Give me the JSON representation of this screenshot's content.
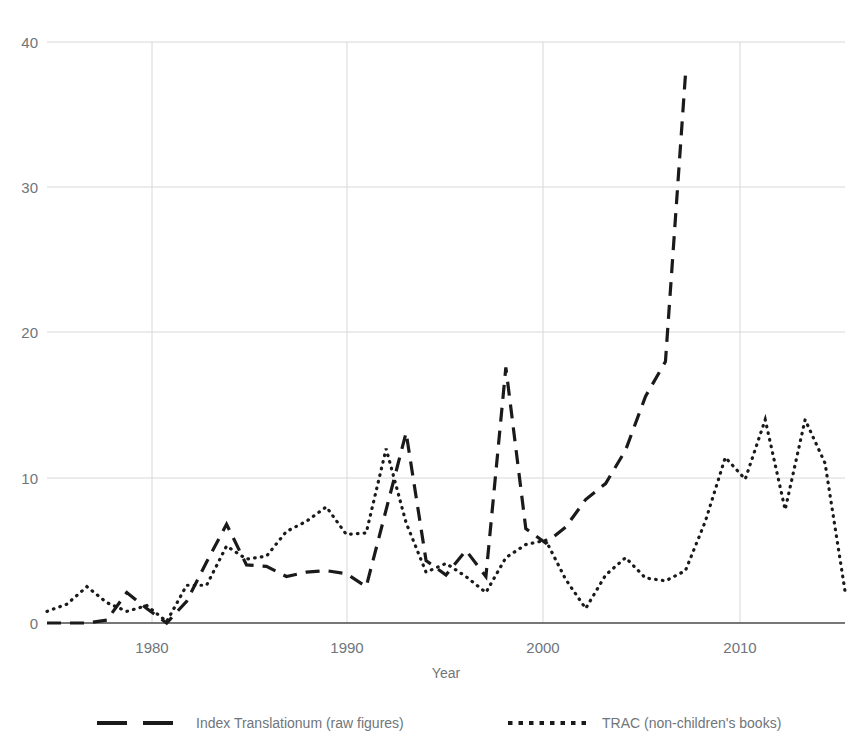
{
  "chart_data": {
    "type": "line",
    "title": "",
    "xlabel": "Year",
    "ylabel": "",
    "xlim": [
      1975,
      2015
    ],
    "ylim": [
      0,
      40
    ],
    "xticks": [
      "1980",
      "1990",
      "2000",
      "2010"
    ],
    "xtick_values": [
      1980,
      1990,
      2000,
      2010
    ],
    "yticks": [
      "0",
      "10",
      "20",
      "30",
      "40"
    ],
    "ytick_values": [
      0,
      10,
      20,
      30,
      40
    ],
    "grid": "both",
    "legend_position": "bottom",
    "x": [
      1975,
      1976,
      1977,
      1978,
      1979,
      1980,
      1981,
      1982,
      1983,
      1984,
      1985,
      1986,
      1987,
      1988,
      1989,
      1990,
      1991,
      1992,
      1993,
      1994,
      1995,
      1996,
      1997,
      1998,
      1999,
      2000,
      2001,
      2002,
      2003,
      2004,
      2005,
      2006,
      2007,
      2008,
      2009,
      2010,
      2011,
      2012,
      2013,
      2014,
      2015
    ],
    "series": [
      {
        "name": "Index Translationum (raw figures)",
        "style": "dashed",
        "color": "#1a1a1a",
        "values": [
          0,
          0,
          0,
          0.2,
          2.1,
          1.0,
          0,
          1.5,
          4.2,
          6.8,
          4.0,
          3.9,
          3.2,
          3.5,
          3.6,
          3.4,
          2.5,
          7.8,
          13.1,
          4.3,
          3.3,
          5.0,
          3.2,
          17.6,
          6.5,
          5.5,
          6.6,
          8.5,
          9.6,
          11.9,
          15.6,
          18.0,
          37.7,
          null,
          null,
          null,
          null,
          null,
          null,
          null,
          null
        ]
      },
      {
        "name": "TRAC (non-children's books)",
        "style": "dotted",
        "color": "#1a1a1a",
        "values": [
          0.8,
          1.3,
          2.5,
          1.4,
          0.8,
          1.2,
          0.1,
          2.6,
          2.6,
          5.3,
          4.4,
          4.6,
          6.3,
          7.0,
          8.0,
          6.1,
          6.2,
          12.0,
          6.9,
          3.5,
          4.1,
          3.2,
          2.1,
          4.5,
          5.4,
          5.7,
          3.0,
          1.0,
          3.3,
          4.5,
          3.1,
          2.9,
          3.6,
          7.0,
          11.4,
          9.9,
          14.0,
          7.8,
          14.0,
          11.0,
          2.2
        ]
      }
    ],
    "annotations": {
      "peak_index_translationum": {
        "year": 2007,
        "value": 37.7
      },
      "secondary_peak_index_translationum": {
        "year": 1998,
        "value": 17.6
      },
      "peak_trac": {
        "year": 2011,
        "value": 14.0
      }
    }
  },
  "legend": {
    "items": [
      {
        "label": "Index Translationum (raw figures)",
        "style": "dashed"
      },
      {
        "label": "TRAC (non-children's books)",
        "style": "dotted"
      }
    ]
  },
  "axis": {
    "x_title": "Year"
  }
}
